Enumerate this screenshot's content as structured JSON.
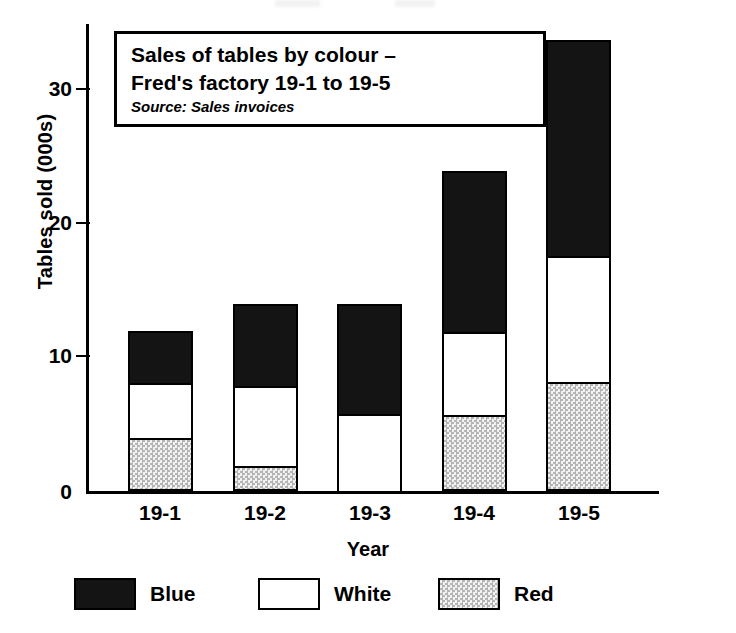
{
  "chart_data": {
    "type": "bar",
    "subtype": "stacked-bar",
    "title": "Sales of tables by colour – Fred's factory 19-1 to 19-5",
    "title_lines": [
      "Sales of tables by colour –",
      "Fred's factory 19-1 to 19-5"
    ],
    "source_note": "Source: Sales invoices",
    "xlabel": "Year",
    "ylabel": "Tables sold (000s)",
    "categories": [
      "19-1",
      "19-2",
      "19-3",
      "19-4",
      "19-5"
    ],
    "series": [
      {
        "name": "Red",
        "values": [
          4.0,
          1.9,
          0.0,
          5.7,
          8.2
        ],
        "fill": "stipple",
        "color": "#e2e2e2"
      },
      {
        "name": "White",
        "values": [
          4.1,
          6.0,
          5.8,
          6.2,
          9.4
        ],
        "fill": "solid",
        "color": "#ffffff"
      },
      {
        "name": "Blue",
        "values": [
          3.9,
          6.1,
          8.2,
          12.1,
          16.2
        ],
        "fill": "solid",
        "color": "#141414"
      }
    ],
    "stack_order_bottom_to_top": [
      "Red",
      "White",
      "Blue"
    ],
    "totals": [
      12.0,
      14.0,
      14.0,
      24.0,
      33.8
    ],
    "ylim": [
      0,
      35
    ],
    "yticks": [
      0,
      10,
      20,
      30
    ],
    "ytick_labels": [
      "0",
      "10",
      "20",
      "30"
    ],
    "grid": false,
    "legend_position": "bottom",
    "legend_entries": [
      {
        "label": "Blue",
        "swatch": "solid-black"
      },
      {
        "label": "White",
        "swatch": "solid-white"
      },
      {
        "label": "Red",
        "swatch": "stipple-grey"
      }
    ]
  },
  "axes": {
    "y_title": "Tables sold (000s)",
    "x_title": "Year",
    "y_ticks": [
      "30",
      "20",
      "10",
      "0"
    ],
    "x_ticks": [
      "19-1",
      "19-2",
      "19-3",
      "19-4",
      "19-5"
    ]
  },
  "title_box": {
    "line1": "Sales of tables by colour –",
    "line2": "Fred's factory 19-1 to 19-5",
    "source": "Source: Sales invoices"
  },
  "legend": {
    "items": [
      {
        "label": "Blue"
      },
      {
        "label": "White"
      },
      {
        "label": "Red"
      }
    ]
  }
}
